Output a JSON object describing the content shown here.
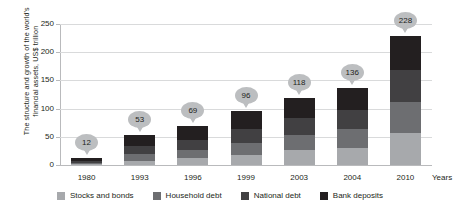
{
  "chart_data": {
    "type": "bar",
    "stacked": true,
    "title": "",
    "ylabel": "The structure and growth of the world's\nfinancial assets, US$ trillion",
    "xlabel": "Years",
    "categories": [
      "1980",
      "1993",
      "1996",
      "1999",
      "2003",
      "2004",
      "2010"
    ],
    "totals": [
      12,
      53,
      69,
      96,
      118,
      136,
      228
    ],
    "ylim": [
      0,
      250
    ],
    "yticks": [
      0,
      50,
      100,
      150,
      200,
      250
    ],
    "grid": true,
    "legend_position": "bottom",
    "series": [
      {
        "name": "Stocks and bonds",
        "color": "#a7a9ac",
        "values": [
          1,
          8,
          12,
          18,
          26,
          31,
          56
        ]
      },
      {
        "name": "Household debt",
        "color": "#6d6e71",
        "values": [
          2,
          11,
          15,
          21,
          27,
          32,
          55
        ]
      },
      {
        "name": "National debt",
        "color": "#414042",
        "values": [
          4,
          14,
          18,
          25,
          31,
          35,
          57
        ]
      },
      {
        "name": "Bank deposits",
        "color": "#231f20",
        "values": [
          5,
          20,
          24,
          32,
          34,
          38,
          60
        ]
      }
    ]
  },
  "axis": {
    "y_title": "The structure and growth of the world's\nfinancial assets, US$ trillion",
    "x_title": "Years",
    "y_ticks": [
      "0",
      "50",
      "100",
      "150",
      "200",
      "250"
    ],
    "x_ticks": [
      "1980",
      "1993",
      "1996",
      "1999",
      "2003",
      "2004",
      "2010"
    ]
  },
  "labels": {
    "values": [
      "12",
      "53",
      "69",
      "96",
      "118",
      "136",
      "228"
    ]
  },
  "legend": {
    "items": [
      {
        "label": "Stocks and bonds",
        "color": "#a7a9ac"
      },
      {
        "label": "Household debt",
        "color": "#6d6e71"
      },
      {
        "label": "National debt",
        "color": "#414042"
      },
      {
        "label": "Bank deposits",
        "color": "#231f20"
      }
    ]
  },
  "colors": {
    "axis": "#b9babc",
    "grid": "#d9dadb",
    "callout": "#bcbec0",
    "text": "#231f20",
    "background": "#ffffff"
  }
}
